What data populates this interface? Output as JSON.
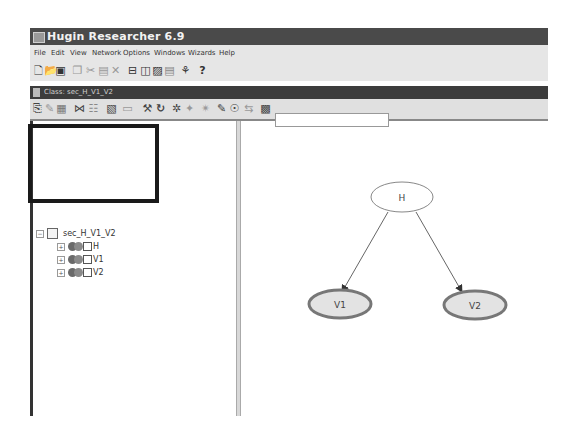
{
  "window": {
    "title": "Hugin Researcher 6.9"
  },
  "menu": {
    "items": [
      "File",
      "Edit",
      "View",
      "Network",
      "Options",
      "Windows",
      "Wizards",
      "Help"
    ]
  },
  "toolbar": {
    "icons": [
      "new-icon",
      "open-icon",
      "save-icon",
      "copy-icon",
      "cut-icon",
      "paste-icon",
      "delete-icon",
      "tile-horizontal-icon",
      "tile-vertical-icon",
      "cascade-icon",
      "arrange-icon",
      "wizard-icon",
      "help-icon"
    ],
    "help_label": "?"
  },
  "class_window": {
    "title": "Class: sec_H_V1_V2"
  },
  "class_toolbar": {
    "search_value": ""
  },
  "tree": {
    "root": "sec_H_V1_V2",
    "nodes": [
      {
        "label": "H"
      },
      {
        "label": "V1"
      },
      {
        "label": "V2"
      }
    ]
  },
  "graph": {
    "nodes": [
      {
        "id": "H",
        "label": "H",
        "cx": 372,
        "cy": 198,
        "fill": "#ffffff"
      },
      {
        "id": "V1",
        "label": "V1",
        "cx": 340,
        "cy": 305,
        "fill": "#e3e3e3"
      },
      {
        "id": "V2",
        "label": "V2",
        "cx": 475,
        "cy": 305,
        "fill": "#e3e3e3"
      }
    ],
    "edges": [
      {
        "from": "H",
        "to": "V1"
      },
      {
        "from": "H",
        "to": "V2"
      }
    ]
  }
}
